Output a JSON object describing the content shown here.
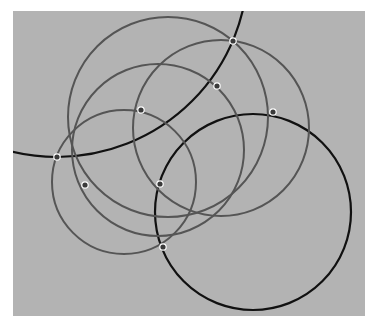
{
  "canvas": {
    "width": 384,
    "height": 328,
    "background": "#ffffff",
    "plane": {
      "x": 13,
      "y": 11,
      "width": 352,
      "height": 305,
      "fill": "#b3b3b3"
    }
  },
  "circles": [
    {
      "id": "black-large-top-left",
      "cx": 57,
      "cy": -34,
      "r": 191,
      "stroke": "#111111",
      "width": 2.2
    },
    {
      "id": "black-bottom-right",
      "cx": 253,
      "cy": 212,
      "r": 98,
      "stroke": "#111111",
      "width": 2.2
    },
    {
      "id": "gray-top-large",
      "cx": 168,
      "cy": 117,
      "r": 100,
      "stroke": "#555555",
      "width": 2
    },
    {
      "id": "gray-right",
      "cx": 221,
      "cy": 128,
      "r": 88,
      "stroke": "#555555",
      "width": 2
    },
    {
      "id": "gray-middle",
      "cx": 158,
      "cy": 150,
      "r": 86,
      "stroke": "#555555",
      "width": 2
    },
    {
      "id": "gray-left-small",
      "cx": 124,
      "cy": 182,
      "r": 72,
      "stroke": "#555555",
      "width": 2
    }
  ],
  "points": [
    {
      "id": "p1",
      "x": 233,
      "y": 41
    },
    {
      "id": "p2",
      "x": 217,
      "y": 86
    },
    {
      "id": "p3",
      "x": 273,
      "y": 112
    },
    {
      "id": "p4",
      "x": 141,
      "y": 110
    },
    {
      "id": "p5",
      "x": 57,
      "y": 157
    },
    {
      "id": "p6",
      "x": 85,
      "y": 185
    },
    {
      "id": "p7",
      "x": 160,
      "y": 184
    },
    {
      "id": "p8",
      "x": 163,
      "y": 247
    }
  ],
  "point_style": {
    "fill": "#3a3a3a",
    "stroke": "#ffffff",
    "r": 3.2,
    "stroke_width": 1.2
  }
}
